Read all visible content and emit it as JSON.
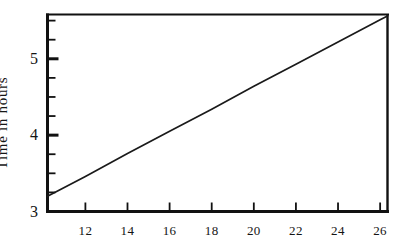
{
  "chart_data": {
    "type": "line",
    "title": "",
    "subtitle": "",
    "xlabel": "",
    "ylabel": "Time in hours",
    "xlim": [
      10.2,
      26.35
    ],
    "ylim": [
      3.0,
      5.58
    ],
    "grid": false,
    "legend": null,
    "xticks": [
      12,
      14,
      16,
      18,
      20,
      22,
      24,
      26
    ],
    "xticklabels": [
      "12",
      "14",
      "16",
      "18",
      "20",
      "22",
      "24",
      "26"
    ],
    "yticks": [
      3,
      4,
      5
    ],
    "yticklabels": [
      "3",
      "4",
      "5"
    ],
    "y_minor_ticks": [
      3.25,
      3.5,
      3.75,
      4.25,
      4.5,
      4.75,
      5.25,
      5.5
    ],
    "series": [
      {
        "name": "time",
        "x": [
          10.2,
          26.35
        ],
        "values": [
          3.2,
          5.56
        ]
      }
    ],
    "points": [
      {
        "x": 10.2,
        "y": 3.2
      },
      {
        "x": 12,
        "y": 3.46
      },
      {
        "x": 14,
        "y": 3.76
      },
      {
        "x": 16,
        "y": 4.05
      },
      {
        "x": 18,
        "y": 4.34
      },
      {
        "x": 20,
        "y": 4.64
      },
      {
        "x": 22,
        "y": 4.93
      },
      {
        "x": 24,
        "y": 5.22
      },
      {
        "x": 26,
        "y": 5.51
      },
      {
        "x": 26.35,
        "y": 5.56
      }
    ],
    "colors": {
      "line": "#1a1a1a",
      "axis": "#111111",
      "background": "#ffffff",
      "text": "#141414"
    }
  },
  "axes": {
    "ylabel_text": "Time in hours"
  }
}
